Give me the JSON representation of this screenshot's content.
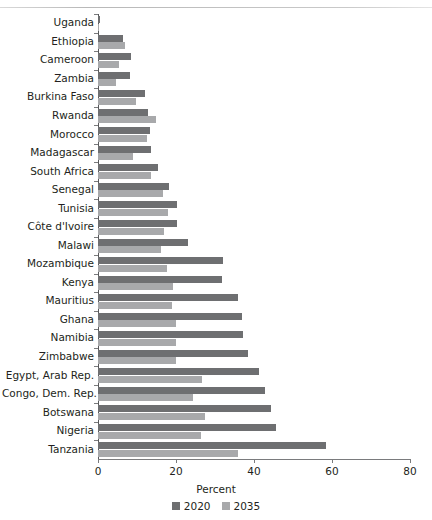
{
  "chart_data": {
    "type": "bar",
    "orientation": "horizontal",
    "title": "",
    "xlabel": "Percent",
    "ylabel": "",
    "xlim": [
      0,
      80
    ],
    "xticks": [
      0,
      20,
      40,
      60,
      80
    ],
    "grid": false,
    "legend_position": "bottom",
    "categories": [
      "Uganda",
      "Ethiopia",
      "Cameroon",
      "Zambia",
      "Burkina Faso",
      "Rwanda",
      "Morocco",
      "Madagascar",
      "South Africa",
      "Senegal",
      "Tunisia",
      "Côte d'Ivoire",
      "Malawi",
      "Mozambique",
      "Kenya",
      "Mauritius",
      "Ghana",
      "Namibia",
      "Zimbabwe",
      "Egypt, Arab Rep.",
      "Congo, Dem. Rep.",
      "Botswana",
      "Nigeria",
      "Tanzania"
    ],
    "series": [
      {
        "name": "2020",
        "color": "#6e6f71",
        "values": [
          0.4,
          6.3,
          8.5,
          8.1,
          12.1,
          12.9,
          13.3,
          13.7,
          15.3,
          18.3,
          20.3,
          20.2,
          23.2,
          32.1,
          31.9,
          35.8,
          36.9,
          37.2,
          38.4,
          41.3,
          42.8,
          44.3,
          45.6,
          58.5
        ]
      },
      {
        "name": "2035",
        "color": "#a8a9ab",
        "values": [
          0.3,
          6.8,
          5.3,
          4.6,
          9.8,
          14.8,
          12.5,
          9.0,
          13.6,
          16.7,
          17.9,
          16.9,
          16.2,
          17.8,
          19.2,
          19.0,
          20.0,
          20.0,
          20.1,
          26.6,
          24.4,
          27.5,
          26.5,
          35.8
        ]
      }
    ]
  },
  "axis": {
    "tick_labels": [
      "0",
      "20",
      "40",
      "60",
      "80"
    ],
    "x_axis_title": "Percent"
  },
  "legend": {
    "entries": [
      {
        "label": "2020",
        "color": "#6e6f71"
      },
      {
        "label": "2035",
        "color": "#a8a9ab"
      }
    ]
  }
}
